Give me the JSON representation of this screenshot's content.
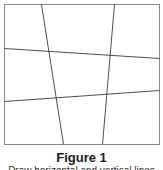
{
  "figure": {
    "title": "Figure 1",
    "caption": "Draw horizontal and vertical lines",
    "frame": {
      "x1": 4,
      "y1": 4,
      "x2": 159,
      "y2": 144,
      "color": "#8a8a8a"
    },
    "line_color": "#3a3a3a",
    "horizontal_lines": [
      {
        "x1": 4,
        "y1": 48,
        "x2": 159,
        "y2": 58
      },
      {
        "x1": 4,
        "y1": 101,
        "x2": 159,
        "y2": 90
      }
    ],
    "vertical_lines": [
      {
        "x1": 41,
        "y1": 4,
        "x2": 63,
        "y2": 144
      },
      {
        "x1": 114,
        "y1": 4,
        "x2": 102,
        "y2": 144
      }
    ]
  }
}
